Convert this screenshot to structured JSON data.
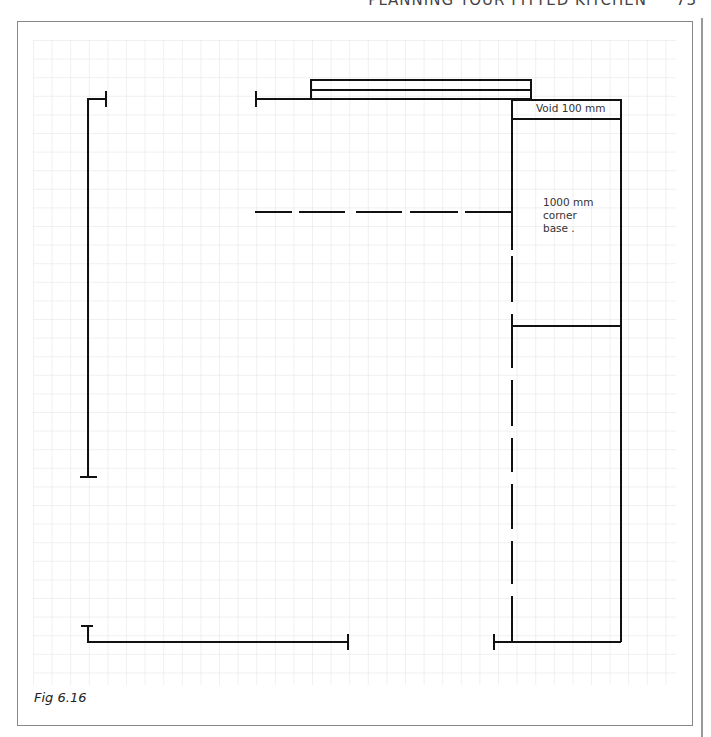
{
  "header": {
    "running_title": "PLANNING YOUR FITTED KITCHEN",
    "page_number": "73"
  },
  "figure": {
    "caption": "Fig 6.16",
    "labels": {
      "void": "Void 100 mm",
      "corner_line1": "1000 mm",
      "corner_line2": "corner",
      "corner_line3": "base ."
    }
  },
  "grid": {
    "spacing_px": 18.6,
    "color": "#e2e2e2"
  },
  "colors": {
    "line": "#111111",
    "frame": "#888888"
  }
}
